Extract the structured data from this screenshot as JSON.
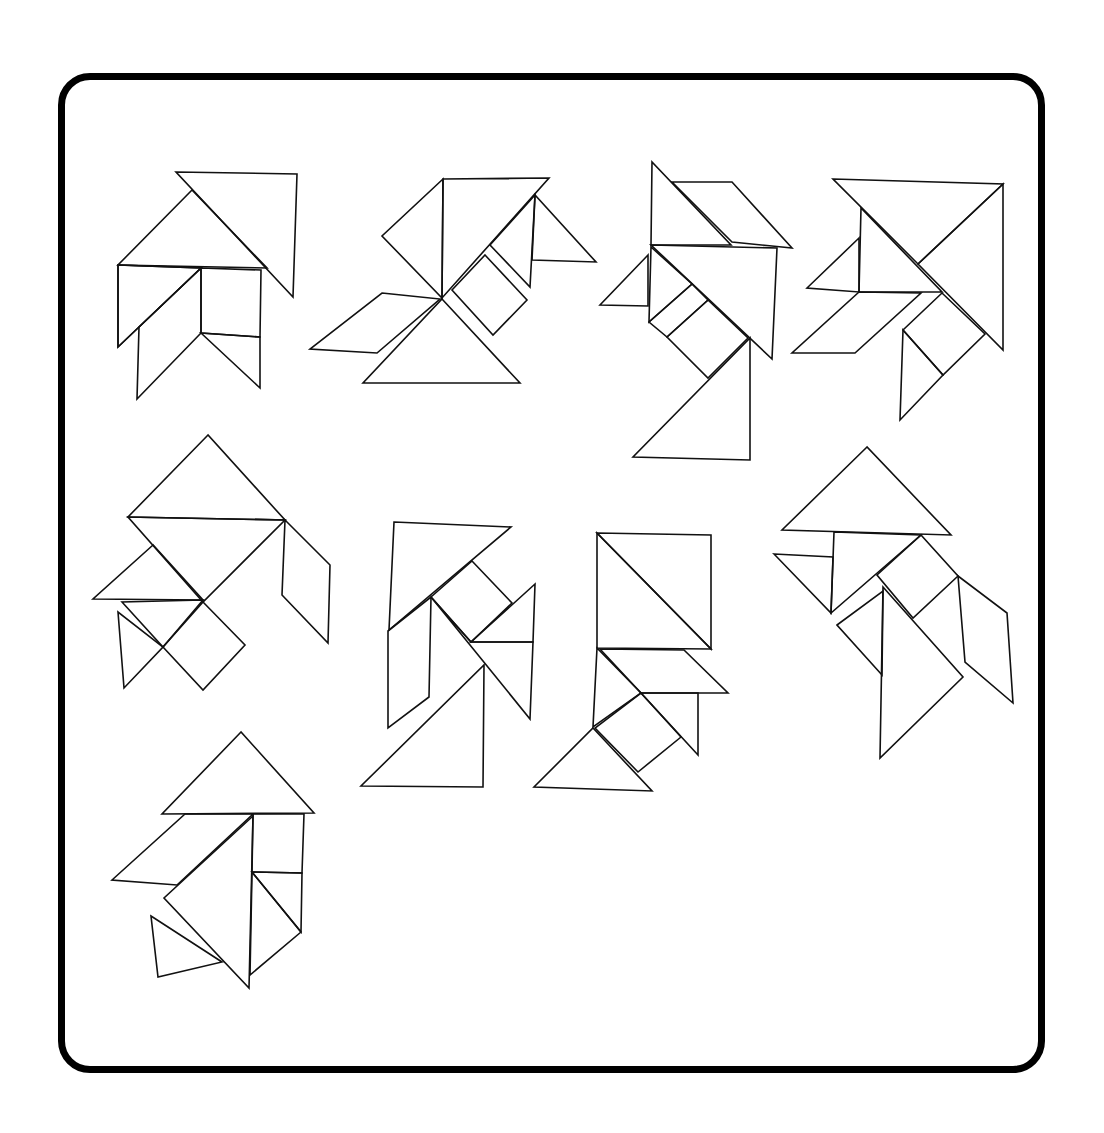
{
  "stroke_color": "#111111",
  "frame_color": "#000000",
  "figures": [
    {
      "name": "figure-1",
      "pieces": [
        "176,172 297,174 293,297",
        "192,190 118,265 267,268",
        "118,265 201,268 118,347",
        "201,268 201,333 137,399 139,327",
        "201,268 261,270 260,337 201,333",
        "201,333 260,337 260,388",
        "118,265 201,268 139,327 118,347"
      ]
    },
    {
      "name": "figure-2",
      "pieces": [
        "443,179 549,178 442,298",
        "443,179 382,236 442,298",
        "535,195 532,260 596,262",
        "535,195 530,287 490,245",
        "485,255 527,300 493,335 452,290",
        "382,293 440,299 377,353 310,349",
        "442,299 520,383 363,383"
      ]
    },
    {
      "name": "figure-3",
      "pieces": [
        "652,162 651,245 731,245",
        "672,182 732,182 792,248 732,242",
        "648,255 600,305 648,306",
        "651,245 777,248 772,359",
        "651,247 649,322 692,284",
        "692,284 708,300 667,337 649,322",
        "708,300 748,338 708,378 667,337",
        "750,338 750,460 633,457"
      ]
    },
    {
      "name": "figure-4",
      "pieces": [
        "833,179 1003,184 918,264",
        "1003,184 918,264 1003,350",
        "861,208 859,292 942,292",
        "859,238 807,288 859,292",
        "859,292 921,293 855,353 792,353",
        "942,293 985,334 943,375 903,330",
        "903,330 943,375 900,420"
      ]
    },
    {
      "name": "figure-5",
      "pieces": [
        "208,435 128,517 285,520",
        "128,517 285,520 203,602",
        "285,520 330,565 328,643 282,595",
        "153,545 93,599 203,600",
        "203,602 245,645 203,690 163,647",
        "122,602 163,647 203,600",
        "118,612 124,688 163,647"
      ]
    },
    {
      "name": "figure-6",
      "pieces": [
        "394,522 511,527 389,630",
        "431,597 429,697 388,728 388,631",
        "472,561 512,603 471,642 431,597",
        "535,584 471,642 533,642",
        "431,597 530,719 533,642 471,642",
        "484,665 483,787 361,786"
      ]
    },
    {
      "name": "figure-7",
      "pieces": [
        "597,533 711,535 711,649",
        "597,533 711,649 597,648",
        "600,649 684,650 728,693 641,693",
        "597,648 593,727 641,693",
        "641,693 681,737 638,772 595,728",
        "641,693 698,693 698,755",
        "593,728 652,791 534,787"
      ]
    },
    {
      "name": "figure-8",
      "pieces": [
        "867,447 782,530 951,535",
        "834,532 831,613 921,535",
        "774,554 833,557 831,613",
        "921,535 958,576 913,618 877,575",
        "837,625 883,591 882,675",
        "883,587 963,677 880,758",
        "958,576 1007,613 1013,703 965,662"
      ]
    },
    {
      "name": "figure-9",
      "pieces": [
        "241,732 162,814 314,813",
        "185,814 253,814 177,885 112,880",
        "253,816 249,988 164,898",
        "253,814 304,814 302,873 252,872",
        "252,872 302,873 301,932",
        "252,872 301,932 250,975",
        "151,916 222,962 158,977"
      ]
    }
  ]
}
